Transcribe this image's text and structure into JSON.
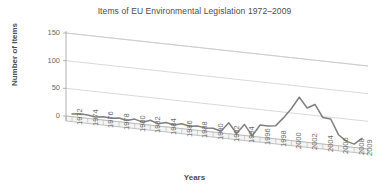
{
  "chart_data": {
    "type": "line",
    "title": "Items of EU Environmental Legislation 1972–2009",
    "xlabel": "Years",
    "ylabel": "Number of items",
    "ylim": [
      0,
      150
    ],
    "yticks": [
      0,
      50,
      100,
      150
    ],
    "grid": true,
    "legend": "none",
    "style": "3d-perspective",
    "xtick_labels": [
      "1972",
      "1974",
      "1976",
      "1978",
      "1980",
      "1982",
      "1984",
      "1986",
      "1988",
      "1990",
      "1992",
      "1994",
      "1996",
      "1998",
      "2000",
      "2002",
      "2004",
      "2006",
      "2008",
      "2009"
    ],
    "x": [
      1972,
      1973,
      1974,
      1975,
      1976,
      1977,
      1978,
      1979,
      1980,
      1981,
      1982,
      1983,
      1984,
      1985,
      1986,
      1987,
      1988,
      1989,
      1990,
      1991,
      1992,
      1993,
      1994,
      1995,
      1996,
      1997,
      1998,
      1999,
      2000,
      2001,
      2002,
      2003,
      2004,
      2005,
      2006,
      2007,
      2008,
      2009
    ],
    "values": [
      5,
      7,
      6,
      4,
      6,
      5,
      7,
      4,
      8,
      4,
      9,
      4,
      8,
      5,
      9,
      6,
      8,
      6,
      7,
      3,
      20,
      2,
      20,
      1,
      22,
      22,
      24,
      40,
      58,
      80,
      62,
      70,
      48,
      47,
      20,
      10,
      6,
      18
    ],
    "series": [
      {
        "name": "Items of EU Environmental Legislation",
        "color": "#808080",
        "values": [
          5,
          7,
          6,
          4,
          6,
          5,
          7,
          4,
          8,
          4,
          9,
          4,
          8,
          5,
          9,
          6,
          8,
          6,
          7,
          3,
          20,
          2,
          20,
          1,
          22,
          22,
          24,
          40,
          58,
          80,
          62,
          70,
          48,
          47,
          20,
          10,
          6,
          18
        ]
      }
    ],
    "annotations": {
      "peak_year": 2001,
      "peak_value": 80,
      "trough_year": 2008,
      "trough_value": 6
    }
  },
  "colors": {
    "line": "#808080",
    "grid": "#c9c9c9",
    "axis": "#a8a8a8",
    "text": "#4d4d4d",
    "tick_text": "#6a6a6a",
    "background": "#ffffff"
  }
}
